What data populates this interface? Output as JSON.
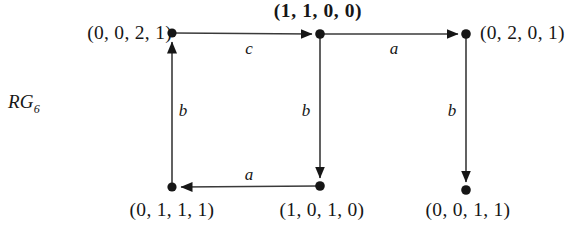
{
  "figure": {
    "name_main": "RG",
    "name_sub": "6",
    "background_color": "#ffffff",
    "ink_color": "#161616"
  },
  "nodes": [
    {
      "id": "n-top-left",
      "label": "(0, 0, 2, 1)",
      "bold": false,
      "x": 172,
      "y": 33,
      "label_x": 162,
      "label_y": 33,
      "label_align": "right"
    },
    {
      "id": "n-top-middle",
      "label": "(1, 1, 0, 0)",
      "bold": true,
      "x": 320,
      "y": 34,
      "label_x": 318,
      "label_y": 9,
      "label_align": "center"
    },
    {
      "id": "n-top-right",
      "label": "(0, 2, 0, 1)",
      "bold": false,
      "x": 466,
      "y": 34,
      "label_x": 480,
      "label_y": 33,
      "label_align": "left"
    },
    {
      "id": "n-bottom-left",
      "label": "(0, 1, 1, 1)",
      "bold": false,
      "x": 172,
      "y": 187,
      "label_x": 172,
      "label_y": 210,
      "label_align": "center"
    },
    {
      "id": "n-bottom-middle",
      "label": "(1, 0, 1, 0)",
      "bold": false,
      "x": 320,
      "y": 186,
      "label_x": 322,
      "label_y": 210,
      "label_align": "center"
    },
    {
      "id": "n-bottom-right",
      "label": "(0, 0, 1, 1)",
      "bold": false,
      "x": 466,
      "y": 190,
      "label_x": 468,
      "label_y": 210,
      "label_align": "center"
    }
  ],
  "edges": [
    {
      "id": "edge-c-top-left-to-middle",
      "label": "c",
      "from": "n-top-left",
      "to": "n-top-middle",
      "label_x": 249,
      "label_y": 47
    },
    {
      "id": "edge-a-top-middle-to-right",
      "label": "a",
      "from": "n-top-middle",
      "to": "n-top-right",
      "label_x": 394,
      "label_y": 47
    },
    {
      "id": "edge-b-bottom-left-to-top",
      "label": "b",
      "from": "n-bottom-left",
      "to": "n-top-left",
      "label_x": 181,
      "label_y": 105
    },
    {
      "id": "edge-b-top-middle-to-bottom",
      "label": "b",
      "from": "n-top-middle",
      "to": "n-bottom-middle",
      "label_x": 303,
      "label_y": 105
    },
    {
      "id": "edge-b-top-right-to-bottom",
      "label": "b",
      "from": "n-top-right",
      "to": "n-bottom-right",
      "label_x": 449,
      "label_y": 105
    },
    {
      "id": "edge-a-bottom-middle-to-left",
      "label": "a",
      "from": "n-bottom-middle",
      "to": "n-bottom-left",
      "label_x": 249,
      "label_y": 174
    }
  ],
  "figure_label_position": {
    "x": 8,
    "y": 101
  }
}
